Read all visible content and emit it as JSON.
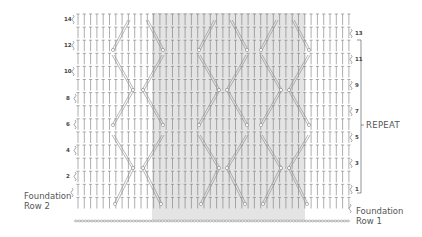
{
  "diagram": {
    "type": "crochet-cable-chart",
    "grid": {
      "x_start": 78,
      "x_end": 350,
      "stitch_spacing": 6.3,
      "row_height": 13.1,
      "top_row_y": 13,
      "total_rows": 15,
      "foundation_chain_y": 221
    },
    "shaded_region": {
      "x_start": 152,
      "x_end": 305,
      "y_start": 13,
      "y_end": 220,
      "color": "#e4e4e4"
    },
    "colors": {
      "stitch": "#777777",
      "cable": "#888888",
      "bracket": "#666666",
      "text": "#555555"
    },
    "left_row_labels": [
      {
        "label": "14",
        "row": 14,
        "x": 68,
        "y": 16
      },
      {
        "label": "12",
        "row": 12,
        "x": 68,
        "y": 42
      },
      {
        "label": "10",
        "row": 10,
        "x": 68,
        "y": 68
      },
      {
        "label": "8",
        "row": 8,
        "x": 70,
        "y": 95
      },
      {
        "label": "6",
        "row": 6,
        "x": 70,
        "y": 121
      },
      {
        "label": "4",
        "row": 4,
        "x": 70,
        "y": 147
      },
      {
        "label": "2",
        "row": 2,
        "x": 70,
        "y": 173
      }
    ],
    "right_row_labels": [
      {
        "label": "13",
        "row": 13,
        "x": 354,
        "y": 30
      },
      {
        "label": "11",
        "row": 11,
        "x": 354,
        "y": 56
      },
      {
        "label": "9",
        "row": 9,
        "x": 354,
        "y": 82
      },
      {
        "label": "7",
        "row": 7,
        "x": 354,
        "y": 108
      },
      {
        "label": "5",
        "row": 5,
        "x": 354,
        "y": 134
      },
      {
        "label": "3",
        "row": 3,
        "x": 354,
        "y": 160
      },
      {
        "label": "1",
        "row": 1,
        "x": 354,
        "y": 186
      }
    ],
    "foundation_row_2": {
      "line1": "Foundation",
      "line2": "Row 2"
    },
    "foundation_row_1": {
      "line1": "Foundation",
      "line2": "Row 1"
    },
    "repeat": {
      "label": "REPEAT",
      "bracket_x": 361,
      "bracket_top": 40,
      "bracket_bottom": 193,
      "tick_y": 125
    },
    "cables": [
      {
        "x1": 114,
        "y1": 204,
        "x2": 132,
        "y2": 168
      },
      {
        "x1": 132,
        "y1": 168,
        "x2": 112,
        "y2": 135
      },
      {
        "x1": 112,
        "y1": 125,
        "x2": 132,
        "y2": 90
      },
      {
        "x1": 132,
        "y1": 90,
        "x2": 112,
        "y2": 55
      },
      {
        "x1": 112,
        "y1": 50,
        "x2": 128,
        "y2": 20
      },
      {
        "x1": 160,
        "y1": 204,
        "x2": 142,
        "y2": 168
      },
      {
        "x1": 142,
        "y1": 168,
        "x2": 162,
        "y2": 135
      },
      {
        "x1": 162,
        "y1": 125,
        "x2": 142,
        "y2": 90
      },
      {
        "x1": 142,
        "y1": 90,
        "x2": 162,
        "y2": 55
      },
      {
        "x1": 162,
        "y1": 50,
        "x2": 146,
        "y2": 20
      },
      {
        "x1": 200,
        "y1": 204,
        "x2": 218,
        "y2": 168
      },
      {
        "x1": 218,
        "y1": 168,
        "x2": 198,
        "y2": 135
      },
      {
        "x1": 198,
        "y1": 125,
        "x2": 218,
        "y2": 90
      },
      {
        "x1": 218,
        "y1": 90,
        "x2": 198,
        "y2": 55
      },
      {
        "x1": 198,
        "y1": 50,
        "x2": 214,
        "y2": 20
      },
      {
        "x1": 244,
        "y1": 204,
        "x2": 226,
        "y2": 168
      },
      {
        "x1": 226,
        "y1": 168,
        "x2": 246,
        "y2": 135
      },
      {
        "x1": 246,
        "y1": 125,
        "x2": 226,
        "y2": 90
      },
      {
        "x1": 226,
        "y1": 90,
        "x2": 246,
        "y2": 55
      },
      {
        "x1": 246,
        "y1": 50,
        "x2": 230,
        "y2": 20
      },
      {
        "x1": 262,
        "y1": 204,
        "x2": 280,
        "y2": 168
      },
      {
        "x1": 280,
        "y1": 168,
        "x2": 260,
        "y2": 135
      },
      {
        "x1": 260,
        "y1": 125,
        "x2": 280,
        "y2": 90
      },
      {
        "x1": 280,
        "y1": 90,
        "x2": 260,
        "y2": 55
      },
      {
        "x1": 260,
        "y1": 50,
        "x2": 276,
        "y2": 20
      },
      {
        "x1": 306,
        "y1": 204,
        "x2": 288,
        "y2": 168
      },
      {
        "x1": 288,
        "y1": 168,
        "x2": 308,
        "y2": 135
      },
      {
        "x1": 308,
        "y1": 125,
        "x2": 288,
        "y2": 90
      },
      {
        "x1": 288,
        "y1": 90,
        "x2": 308,
        "y2": 55
      },
      {
        "x1": 308,
        "y1": 50,
        "x2": 292,
        "y2": 20
      }
    ]
  }
}
